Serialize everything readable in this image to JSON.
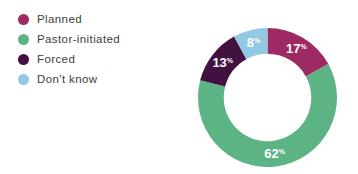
{
  "chart_data": {
    "type": "pie",
    "subtype": "donut",
    "title": "",
    "unit": "%",
    "start_angle_deg_from_top": 0,
    "direction": "clockwise",
    "inner_radius_ratio": 0.63,
    "value_label_color": "#ffffff",
    "legend_position": "top-left",
    "segments": [
      {
        "label": "Planned",
        "value": 17,
        "color": "#9e2a63"
      },
      {
        "label": "Pastor-initiated",
        "value": 62,
        "color": "#5cb484"
      },
      {
        "label": "Forced",
        "value": 13,
        "color": "#42113f"
      },
      {
        "label": "Don't know",
        "value": 8,
        "color": "#92c9e2"
      }
    ]
  },
  "legend": {
    "text_color": "#3d3d3d"
  }
}
